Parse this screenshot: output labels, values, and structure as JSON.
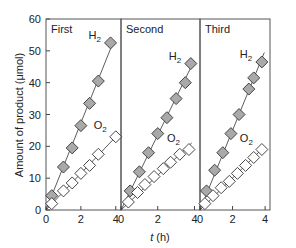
{
  "chart_data": {
    "type": "scatter",
    "ylabel": "Amount of product (μmol)",
    "xlabel": "t (h)",
    "ylim": [
      0,
      60
    ],
    "yticks": [
      0,
      10,
      20,
      30,
      40,
      50,
      60
    ],
    "xlim": [
      0,
      4.2
    ],
    "xticks": [
      0,
      2,
      4
    ],
    "grid": false,
    "legend": "inline labels",
    "panels": [
      {
        "title": "First",
        "series": [
          {
            "name": "H2",
            "marker": "filled-gray-diamond",
            "x": [
              0.33,
              1.0,
              1.5,
              2.0,
              2.5,
              3.0,
              3.7
            ],
            "y": [
              4.5,
              13.5,
              19.5,
              26.5,
              33.5,
              40.5,
              52.5
            ]
          },
          {
            "name": "O2",
            "marker": "open-diamond",
            "x": [
              0.33,
              1.0,
              1.5,
              2.0,
              2.5,
              3.0,
              4.0
            ],
            "y": [
              2.0,
              6.0,
              8.5,
              11.5,
              14.0,
              17.5,
              23.0
            ]
          }
        ]
      },
      {
        "title": "Second",
        "series": [
          {
            "name": "H2",
            "marker": "filled-gray-diamond",
            "x": [
              0.5,
              1.0,
              1.5,
              2.0,
              2.5,
              3.0,
              3.5,
              3.8
            ],
            "y": [
              6.0,
              12.0,
              18.0,
              24.0,
              29.0,
              35.0,
              40.0,
              46.0
            ]
          },
          {
            "name": "O2",
            "marker": "open-diamond",
            "x": [
              0.4,
              0.9,
              1.3,
              1.8,
              2.3,
              2.7,
              3.2,
              3.7
            ],
            "y": [
              2.5,
              5.5,
              8.0,
              10.5,
              13.0,
              15.0,
              17.5,
              19.0
            ]
          }
        ]
      },
      {
        "title": "Third",
        "series": [
          {
            "name": "H2",
            "marker": "filled-gray-diamond",
            "x": [
              0.4,
              0.9,
              1.4,
              1.9,
              2.4,
              3.0,
              3.3,
              3.8
            ],
            "y": [
              6.0,
              12.5,
              18.0,
              24.0,
              30.0,
              38.0,
              41.5,
              46.5
            ]
          },
          {
            "name": "O2",
            "marker": "open-diamond",
            "x": [
              0.3,
              0.8,
              1.3,
              1.8,
              2.3,
              2.8,
              3.3,
              3.8
            ],
            "y": [
              2.0,
              4.5,
              7.0,
              9.0,
              11.5,
              14.0,
              16.5,
              19.0
            ]
          }
        ]
      }
    ]
  },
  "labels": {
    "h2": "H",
    "o2": "O",
    "sub2": "2",
    "ylabel": "Amount of product (μmol)",
    "xlabel_t": "t",
    "xlabel_unit": " (h)"
  },
  "colors": {
    "filled_marker": "#a9a9a9",
    "open_marker": "#ffffff",
    "line": "#333333"
  }
}
